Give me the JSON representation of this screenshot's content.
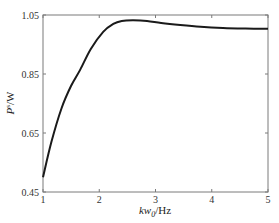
{
  "chart_data": {
    "type": "line",
    "title": "",
    "xlabel": "kw0/Hz",
    "xlabel_parts": {
      "main": "kw",
      "sub": "0",
      "unit": "/Hz"
    },
    "ylabel": "P^s/W",
    "ylabel_parts": {
      "main": "P",
      "sup": "s",
      "unit": "/W"
    },
    "xlim": [
      1,
      5
    ],
    "ylim": [
      0.45,
      1.05
    ],
    "xticks": [
      1,
      2,
      3,
      4,
      5
    ],
    "xtick_labels": [
      "1",
      "2",
      "3",
      "4",
      "5"
    ],
    "yticks": [
      0.45,
      0.65,
      0.85,
      1.05
    ],
    "ytick_labels": [
      "0.45",
      "0.65",
      "0.85",
      "1.05"
    ],
    "grid": false,
    "legend": null,
    "series": [
      {
        "name": "P^s",
        "color": "#1a1a1a",
        "x": [
          1.0,
          1.15,
          1.33,
          1.5,
          1.66,
          1.85,
          2.07,
          2.25,
          2.4,
          2.6,
          2.85,
          3.1,
          3.44,
          3.8,
          4.2,
          4.6,
          5.0
        ],
        "y": [
          0.5,
          0.62,
          0.734,
          0.81,
          0.864,
          0.935,
          0.993,
          1.02,
          1.03,
          1.032,
          1.03,
          1.023,
          1.016,
          1.01,
          1.006,
          1.004,
          1.003
        ]
      }
    ]
  }
}
